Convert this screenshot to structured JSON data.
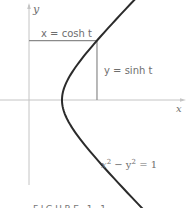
{
  "figure": {
    "caption": "FIGURE 1.1",
    "labels": {
      "y_axis": "y",
      "x_axis": "x",
      "horizontal_segment": "x = cosh t",
      "vertical_segment": "y = sinh t",
      "curve_equation_base": "x",
      "curve_equation_minus": " − y",
      "curve_equation_rhs": " = 1",
      "superscript": "2"
    },
    "colors": {
      "curve": "#2b2b2b",
      "axis": "#bdbdbd",
      "segment": "#8a8a8a",
      "text": "#6e6e6e"
    }
  },
  "chart_data": {
    "type": "line",
    "title": "",
    "xlabel": "x",
    "ylabel": "y",
    "series": [
      {
        "name": "x^2 - y^2 = 1 (right branch)",
        "parametric": {
          "x": "cosh t",
          "y": "sinh t"
        },
        "t_range": [
          -2.35,
          1.95
        ]
      }
    ],
    "marked_point": {
      "t": 1.35,
      "x": 2.06,
      "y": 1.8
    },
    "annotations": [
      "x = cosh t",
      "y = sinh t",
      "x² − y² = 1"
    ],
    "grid": false
  }
}
